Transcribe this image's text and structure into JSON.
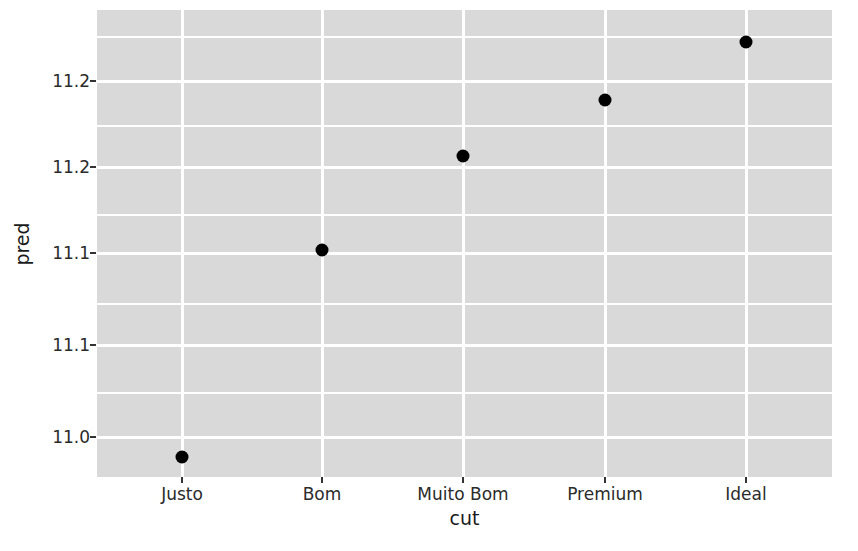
{
  "chart_data": {
    "type": "scatter",
    "title": "",
    "xlabel": "cut",
    "ylabel": "pred",
    "categories": [
      "Justo",
      "Bom",
      "Muito Bom",
      "Premium",
      "Ideal"
    ],
    "values": [
      10.98,
      11.11,
      11.16,
      11.18,
      11.24
    ],
    "series": [
      {
        "name": "pred",
        "values": [
          10.98,
          11.11,
          11.16,
          11.18,
          11.24
        ]
      }
    ],
    "points": [
      {
        "x": "Justo",
        "y": 10.98,
        "px": 182,
        "py": 457
      },
      {
        "x": "Bom",
        "y": 11.11,
        "px": 322,
        "py": 250
      },
      {
        "x": "Muito Bom",
        "y": 11.16,
        "px": 463,
        "py": 156
      },
      {
        "x": "Premium",
        "y": 11.18,
        "px": 605,
        "py": 100
      },
      {
        "x": "Ideal",
        "y": 11.24,
        "px": 746,
        "py": 42
      }
    ],
    "y_ticks": [
      {
        "label": "11.2",
        "value": 11.2,
        "py": 81
      },
      {
        "label": "11.2",
        "value": 11.15,
        "py": 167
      },
      {
        "label": "11.1",
        "value": 11.1,
        "py": 253
      },
      {
        "label": "11.1",
        "value": 11.05,
        "py": 345
      },
      {
        "label": "11.0",
        "value": 11.0,
        "py": 437
      }
    ],
    "x_ticks": [
      {
        "label": "Justo",
        "px": 182
      },
      {
        "label": "Bom",
        "px": 322
      },
      {
        "label": "Muito Bom",
        "px": 463
      },
      {
        "label": "Premium",
        "px": 605
      },
      {
        "label": "Ideal",
        "px": 746
      }
    ],
    "ylim": [
      10.955,
      11.262
    ],
    "grid": true,
    "legend": "none",
    "colors": {
      "panel_background": "#d9d9d9",
      "gridline": "#ffffff",
      "point": "#000000",
      "text": "#2b2b2b",
      "page_background": "#ffffff"
    }
  },
  "axis": {
    "y_title": "pred",
    "x_title": "cut"
  }
}
